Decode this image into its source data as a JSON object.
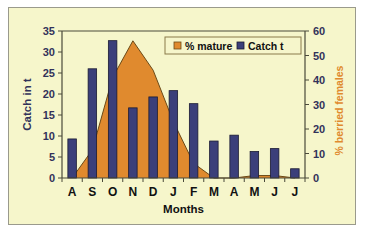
{
  "chart_data": {
    "type": "bar",
    "title": "",
    "xlabel": "Months",
    "ylabel": "Catch in t",
    "y2label": "% berried females",
    "categories": [
      "A",
      "S",
      "O",
      "N",
      "D",
      "J",
      "F",
      "M",
      "A",
      "M",
      "J",
      "J"
    ],
    "ylim": [
      0,
      35
    ],
    "yticks": [
      0,
      5,
      10,
      15,
      20,
      25,
      30,
      35
    ],
    "y2lim": [
      0,
      60
    ],
    "y2ticks": [
      0,
      10,
      20,
      30,
      40,
      50,
      60
    ],
    "grid": false,
    "legend_position": "top-right",
    "series": [
      {
        "name": "% mature",
        "type": "area",
        "axis": "right",
        "color": "#e08a2e",
        "values": [
          0.0,
          11.5,
          41.0,
          56.0,
          44.0,
          23.0,
          6.0,
          0.0,
          0.0,
          1.0,
          1.0,
          0.0
        ]
      },
      {
        "name": "Catch t",
        "type": "bar",
        "axis": "left",
        "color": "#3b3f7a",
        "values": [
          9.3,
          26.0,
          32.7,
          16.7,
          19.3,
          20.8,
          17.7,
          8.8,
          10.2,
          6.3,
          7.0,
          2.2
        ]
      }
    ],
    "legend": [
      "% mature",
      "Catch t"
    ]
  }
}
